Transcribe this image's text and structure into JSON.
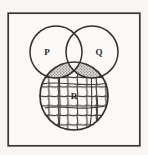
{
  "figure": {
    "kind": "venn-diagram",
    "title_text": "",
    "background_color": "#f7f6f4",
    "ink_color": "#332f2c",
    "frame": {
      "name": "universal-set-box",
      "x": 8,
      "y": 13,
      "width": 132,
      "height": 133,
      "stroke_color": "#3a3633",
      "stroke_width": 1.6,
      "fill_color": "#fbfaf8"
    },
    "sets": [
      {
        "id": "P",
        "label": "P",
        "cx": 56,
        "cy": 52,
        "r": 26,
        "label_x": 47,
        "label_y": 55,
        "fill": "none",
        "stroke_color": "#332f2c"
      },
      {
        "id": "Q",
        "label": "Q",
        "cx": 92,
        "cy": 52,
        "r": 26,
        "label_x": 98,
        "label_y": 55,
        "fill": "none",
        "stroke_color": "#332f2c"
      },
      {
        "id": "R",
        "label": "R",
        "cx": 74,
        "cy": 96,
        "r": 34,
        "label_x": 74,
        "label_y": 99,
        "fill": "cross-hatch",
        "stroke_color": "#332f2c"
      }
    ],
    "shaded_regions": [
      {
        "id": "P-and-R",
        "name": "p-intersect-r-region",
        "expression": "P ∩ R",
        "pattern": "stipple",
        "pattern_color": "#6e6a66",
        "pattern_bg": "#dedad6"
      },
      {
        "id": "Q-and-R",
        "name": "q-intersect-r-region",
        "expression": "Q ∩ R",
        "pattern": "stipple",
        "pattern_color": "#6e6a66",
        "pattern_bg": "#dedad6"
      },
      {
        "id": "R-all",
        "name": "r-region",
        "expression": "R",
        "pattern": "cross-hatch",
        "pattern_color": "#3d3935",
        "pattern_bg": "#fbfaf8"
      }
    ],
    "unshaded_regions": [
      {
        "id": "P-only",
        "expression": "P only"
      },
      {
        "id": "Q-only",
        "expression": "Q only"
      },
      {
        "id": "P-and-Q-only",
        "expression": "P ∩ Q, outside R"
      },
      {
        "id": "P-and-Q-and-R",
        "expression": "P ∩ Q ∩ R"
      }
    ]
  }
}
